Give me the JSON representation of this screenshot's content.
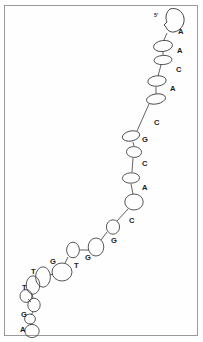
{
  "figure": {
    "border_color": "#9a9a9a",
    "stroke_color": "#3a3a3a",
    "label_color": "#1c1c1c",
    "background_color": "#ffffff"
  },
  "end_marker": {
    "label": "5'",
    "x": 154,
    "y": 16
  },
  "terminal_blob": {
    "name": "chain-terminus-blob",
    "path": "M 170 9 C 176 7 183 11 184 18 C 185 25 180 31 174 32 C 170 32.5 167 30 166 27 L 164 25 L 167 22 C 165 18 166 12 170 9 Z"
  },
  "chain": {
    "nodes": [
      {
        "base": "A",
        "cx": 168,
        "cy": 24,
        "rx": 0,
        "ry": 0,
        "rot": 0,
        "label_x": 178,
        "label_y": 32,
        "has_ellipse": false
      },
      {
        "base": "A",
        "cx": 163,
        "cy": 46,
        "rx": 9.5,
        "ry": 5.5,
        "rot": -8,
        "label_x": 177,
        "label_y": 51,
        "has_ellipse": true
      },
      {
        "base": "C",
        "cx": 163,
        "cy": 60,
        "rx": 9.0,
        "ry": 4.6,
        "rot": -4,
        "label_x": 176,
        "label_y": 70,
        "has_ellipse": true
      },
      {
        "base": "A",
        "cx": 157,
        "cy": 81,
        "rx": 9.2,
        "ry": 5.2,
        "rot": -6,
        "label_x": 170,
        "label_y": 89,
        "has_ellipse": true
      },
      {
        "base": "C",
        "cx": 156,
        "cy": 99,
        "rx": 9.6,
        "ry": 5.0,
        "rot": -10,
        "label_x": 154,
        "label_y": 123,
        "has_ellipse": true
      },
      {
        "base": "G",
        "cx": 131,
        "cy": 136,
        "rx": 8.8,
        "ry": 5.0,
        "rot": -12,
        "label_x": 142,
        "label_y": 140,
        "has_ellipse": true
      },
      {
        "base": "C",
        "cx": 134,
        "cy": 152,
        "rx": 7.6,
        "ry": 5.4,
        "rot": 4,
        "label_x": 142,
        "label_y": 164,
        "has_ellipse": true
      },
      {
        "base": "A",
        "cx": 131,
        "cy": 178,
        "rx": 8.6,
        "ry": 5.2,
        "rot": -2,
        "label_x": 142,
        "label_y": 188,
        "has_ellipse": true
      },
      {
        "base": "C",
        "cx": 134,
        "cy": 202,
        "rx": 9.2,
        "ry": 8.0,
        "rot": 0,
        "label_x": 129,
        "label_y": 221,
        "has_ellipse": true
      },
      {
        "base": "G",
        "cx": 113,
        "cy": 227,
        "rx": 6.6,
        "ry": 7.2,
        "rot": 0,
        "label_x": 111,
        "label_y": 241,
        "has_ellipse": true
      },
      {
        "base": "G",
        "cx": 96,
        "cy": 247,
        "rx": 7.8,
        "ry": 9.0,
        "rot": 0,
        "label_x": 85,
        "label_y": 258,
        "has_ellipse": true
      },
      {
        "base": "T",
        "cx": 73,
        "cy": 250,
        "rx": 6.4,
        "ry": 7.8,
        "rot": 0,
        "label_x": 74,
        "label_y": 266,
        "has_ellipse": true
      },
      {
        "base": "G",
        "cx": 62,
        "cy": 272,
        "rx": 10.0,
        "ry": 9.0,
        "rot": 0,
        "label_x": 50,
        "label_y": 262,
        "has_ellipse": true
      },
      {
        "base": "T",
        "cx": 43,
        "cy": 277,
        "rx": 7.4,
        "ry": 10.2,
        "rot": 0,
        "label_x": 31,
        "label_y": 272,
        "has_ellipse": true
      },
      {
        "base": "T",
        "cx": 33,
        "cy": 285,
        "rx": 6.8,
        "ry": 9.2,
        "rot": 0,
        "label_x": 22,
        "label_y": 288,
        "has_ellipse": true
      },
      {
        "base": "G",
        "cx": 34,
        "cy": 305,
        "rx": 6.2,
        "ry": 6.8,
        "rot": 0,
        "label_x": 21,
        "label_y": 315,
        "has_ellipse": true
      },
      {
        "base": "A",
        "cx": 30,
        "cy": 319,
        "rx": 5.4,
        "ry": 5.0,
        "rot": 0,
        "label_x": 20,
        "label_y": 330,
        "has_ellipse": true
      },
      {
        "base": "",
        "cx": 32,
        "cy": 331,
        "rx": 7.2,
        "ry": 6.6,
        "rot": 0,
        "label_x": 0,
        "label_y": 0,
        "has_ellipse": true
      }
    ],
    "extra_nodes": [
      {
        "name": "side-node-upper",
        "cx": 26,
        "cy": 296,
        "rx": 6.0,
        "ry": 6.4,
        "rot": 0
      }
    ],
    "bonds": [
      {
        "x1": 167,
        "y1": 33,
        "x2": 164,
        "y2": 40
      },
      {
        "x1": 163,
        "y1": 52,
        "x2": 163,
        "y2": 55
      },
      {
        "x1": 161,
        "y1": 65,
        "x2": 158,
        "y2": 76
      },
      {
        "x1": 156,
        "y1": 87,
        "x2": 156,
        "y2": 94
      },
      {
        "x1": 149,
        "y1": 104,
        "x2": 137,
        "y2": 131
      },
      {
        "x1": 133,
        "y1": 142,
        "x2": 134,
        "y2": 146
      },
      {
        "x1": 133,
        "y1": 158,
        "x2": 132,
        "y2": 172
      },
      {
        "x1": 131,
        "y1": 184,
        "x2": 133,
        "y2": 194
      },
      {
        "x1": 128,
        "y1": 209,
        "x2": 117,
        "y2": 221
      },
      {
        "x1": 107,
        "y1": 232,
        "x2": 101,
        "y2": 240
      },
      {
        "x1": 89,
        "y1": 250,
        "x2": 80,
        "y2": 250
      },
      {
        "x1": 68,
        "y1": 257,
        "x2": 65,
        "y2": 263
      },
      {
        "x1": 53,
        "y1": 274,
        "x2": 50,
        "y2": 275
      },
      {
        "x1": 37,
        "y1": 281,
        "x2": 36,
        "y2": 282
      },
      {
        "x1": 32,
        "y1": 294,
        "x2": 33,
        "y2": 298
      },
      {
        "x1": 33,
        "y1": 312,
        "x2": 31,
        "y2": 315
      },
      {
        "x1": 30,
        "y1": 324,
        "x2": 31,
        "y2": 325
      },
      {
        "x1": 28,
        "y1": 299,
        "x2": 31,
        "y2": 302
      }
    ]
  },
  "sequence": {
    "bases": [
      "A",
      "A",
      "C",
      "A",
      "C",
      "G",
      "C",
      "A",
      "C",
      "G",
      "G",
      "G",
      "T",
      "G",
      "T",
      "T",
      "G",
      "A"
    ],
    "length": 18
  }
}
